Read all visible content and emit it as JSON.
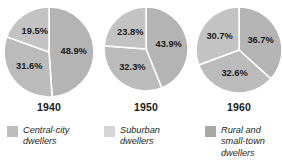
{
  "chart_data": {
    "type": "pie",
    "title": "",
    "subtitle": "",
    "xlabel": "",
    "ylabel": "",
    "grid": false,
    "legend_position": "bottom",
    "legend": [
      {
        "label": "Central-city\ndwellers",
        "color": "#bdbdbd",
        "swatch_name": "central-city-dwellers"
      },
      {
        "label": "Suburban\ndwellers",
        "color": "#d6d6d6",
        "swatch_name": "suburban-dwellers"
      },
      {
        "label": "Rural and\nsmall-town\ndwellers",
        "color": "#a9a9a9",
        "swatch_name": "rural-small-town-dwellers"
      }
    ],
    "categories": [
      "Central-city dwellers",
      "Suburban dwellers",
      "Rural and small-town dwellers"
    ],
    "charts": [
      {
        "year": "1940",
        "radius": 45,
        "slices": [
          {
            "category": "Central-city dwellers",
            "value": 19.5,
            "label": "19.5%",
            "color": "#c3c3c3"
          },
          {
            "category": "Suburban dwellers",
            "value": 31.6,
            "label": "31.6%",
            "color": "#bbbbbb"
          },
          {
            "category": "Rural and small-town dwellers",
            "value": 48.9,
            "label": "48.9%",
            "color": "#b4b4b4"
          }
        ]
      },
      {
        "year": "1950",
        "radius": 42,
        "slices": [
          {
            "category": "Central-city dwellers",
            "value": 23.8,
            "label": "23.8%",
            "color": "#c3c3c3"
          },
          {
            "category": "Suburban dwellers",
            "value": 32.3,
            "label": "32.3%",
            "color": "#bbbbbb"
          },
          {
            "category": "Rural and small-town dwellers",
            "value": 43.9,
            "label": "43.9%",
            "color": "#b4b4b4"
          }
        ]
      },
      {
        "year": "1960",
        "radius": 43,
        "slices": [
          {
            "category": "Central-city dwellers",
            "value": 30.7,
            "label": "30.7%",
            "color": "#c3c3c3"
          },
          {
            "category": "Suburban dwellers",
            "value": 32.6,
            "label": "32.6%",
            "color": "#bbbbbb"
          },
          {
            "category": "Rural and small-town dwellers",
            "value": 36.7,
            "label": "36.7%",
            "color": "#b4b4b4"
          }
        ]
      }
    ]
  }
}
